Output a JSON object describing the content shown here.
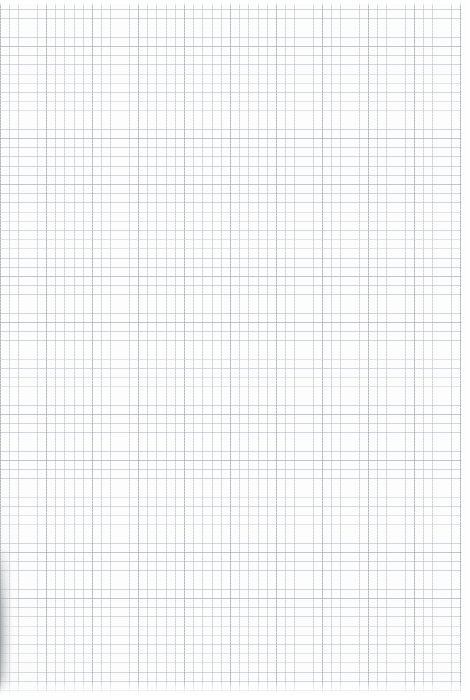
{
  "document": {
    "kind": "scanned-graph-paper",
    "title": "",
    "visible_text": [],
    "width_px": 470,
    "height_px": 700
  },
  "paper": {
    "background_color": "#fdfdfd",
    "surface_color": "#fefefe",
    "description": "blank quadrille / graph ruled sheet, no writing or printed content"
  },
  "grid": {
    "minor_line_color": "#969da3",
    "minor_spacing_px": 9.2,
    "minor_line_width_px": 0.9,
    "major_line_color": "#848c93",
    "major_spacing_px": 46,
    "major_every_n_cells": 5,
    "major_line_width_px": 1.05,
    "origin_x_px": 0,
    "origin_y_px": 0,
    "extent_width_px": 462,
    "extent_height_px": 694
  },
  "margins": {
    "top_fade_px": 6,
    "right_white_px": 9,
    "bottom_fade_px": 18,
    "left_px": 0
  },
  "scan_artifacts": {
    "left_edge_shadow": {
      "color": "#787c80",
      "x_px": 0,
      "y_px": 548,
      "width_px": 14,
      "height_px": 146,
      "note": "dark scanner edge shadow along lower-left of the sheet"
    },
    "left_edge_soft_shadow": {
      "color": "#cdd0d3",
      "x_px": 0,
      "y_px": 470,
      "width_px": 22,
      "height_px": 225
    },
    "vignette_color": "#f1f2f3",
    "grain": true
  }
}
